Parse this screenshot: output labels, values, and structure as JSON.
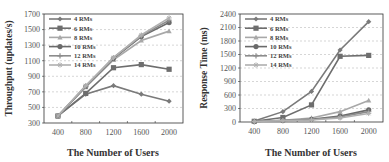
{
  "chart_data": [
    {
      "type": "line",
      "title": "",
      "xlabel": "The Number of Users",
      "ylabel": "Throughput (updates/s)",
      "x": [
        400,
        800,
        1200,
        1600,
        2000
      ],
      "xticks": [
        "400",
        "800",
        "1200",
        "1600",
        "2000"
      ],
      "yticks": [
        "300",
        "500",
        "700",
        "900",
        "1100",
        "1300",
        "1500",
        "1700"
      ],
      "ylim": [
        300,
        1700
      ],
      "grid": "horizontal dashed",
      "legend_position": "upper left",
      "series": [
        {
          "name": "4 RMs",
          "marker": "diamond",
          "color": "#7a7a7a",
          "values": [
            390,
            670,
            780,
            670,
            580
          ]
        },
        {
          "name": "6 RMs",
          "marker": "square",
          "color": "#6e6e6e",
          "values": [
            390,
            680,
            1010,
            1050,
            990
          ]
        },
        {
          "name": "8 RMs",
          "marker": "triangle",
          "color": "#a8a8a8",
          "values": [
            390,
            760,
            1110,
            1360,
            1480
          ]
        },
        {
          "name": "10 RMs",
          "marker": "circle",
          "color": "#6a6a6a",
          "values": [
            390,
            770,
            1130,
            1410,
            1590
          ]
        },
        {
          "name": "12 RMs",
          "marker": "plus",
          "color": "#8c8c8c",
          "values": [
            390,
            770,
            1140,
            1420,
            1620
          ]
        },
        {
          "name": "14 RMs",
          "marker": "star",
          "color": "#b0b0b0",
          "values": [
            390,
            780,
            1140,
            1430,
            1650
          ]
        }
      ]
    },
    {
      "type": "line",
      "title": "",
      "xlabel": "The Number of Users",
      "ylabel": "Response Time (ms)",
      "x": [
        400,
        800,
        1200,
        1600,
        2000
      ],
      "xticks": [
        "400",
        "800",
        "1200",
        "1600",
        "2000"
      ],
      "yticks": [
        "0",
        "300",
        "600",
        "900",
        "1200",
        "1500",
        "1800",
        "2100",
        "2400"
      ],
      "ylim": [
        0,
        2400
      ],
      "grid": "horizontal dashed",
      "legend_position": "upper left",
      "series": [
        {
          "name": "4 RMs",
          "marker": "diamond",
          "color": "#7a7a7a",
          "values": [
            20,
            230,
            680,
            1600,
            2230
          ]
        },
        {
          "name": "6 RMs",
          "marker": "square",
          "color": "#6e6e6e",
          "values": [
            15,
            100,
            380,
            1460,
            1480
          ]
        },
        {
          "name": "8 RMs",
          "marker": "triangle",
          "color": "#a8a8a8",
          "values": [
            10,
            40,
            90,
            230,
            480
          ]
        },
        {
          "name": "10 RMs",
          "marker": "circle",
          "color": "#6a6a6a",
          "values": [
            10,
            35,
            60,
            130,
            270
          ]
        },
        {
          "name": "12 RMs",
          "marker": "plus",
          "color": "#8c8c8c",
          "values": [
            10,
            30,
            50,
            110,
            230
          ]
        },
        {
          "name": "14 RMs",
          "marker": "star",
          "color": "#b0b0b0",
          "values": [
            10,
            30,
            45,
            90,
            190
          ]
        }
      ]
    }
  ]
}
